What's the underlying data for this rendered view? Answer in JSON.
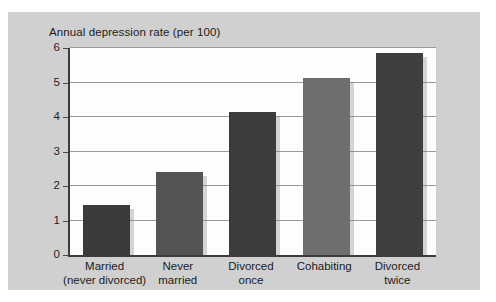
{
  "chart_data": {
    "type": "bar",
    "title": "Annual depression rate (per 100)",
    "xlabel": "",
    "ylabel": "",
    "categories": [
      "Married\n(never divorced)",
      "Never\nmarried",
      "Divorced\nonce",
      "Cohabiting",
      "Divorced\ntwice"
    ],
    "category_lines": [
      [
        "Married",
        "(never divorced)"
      ],
      [
        "Never",
        "married"
      ],
      [
        "Divorced",
        "once"
      ],
      [
        "Cohabiting",
        ""
      ],
      [
        "Divorced",
        "twice"
      ]
    ],
    "values": [
      1.45,
      2.4,
      4.15,
      5.12,
      5.85
    ],
    "bar_colors": [
      "#3a3a3a",
      "#545454",
      "#3c3c3c",
      "#6e6e6e",
      "#3f3f3f"
    ],
    "ylim": [
      0,
      6
    ],
    "yticks": [
      0,
      1,
      2,
      3,
      4,
      5,
      6
    ],
    "ytick_labels": [
      "0",
      "1",
      "2",
      "3",
      "4",
      "5",
      "6"
    ],
    "grid": true,
    "legend": "none",
    "plot_background": "#fdfdfd",
    "figure_background": "#d0d0d0",
    "gridline_color": "#9a9a9a",
    "axis_color": "#3c3c3c"
  }
}
